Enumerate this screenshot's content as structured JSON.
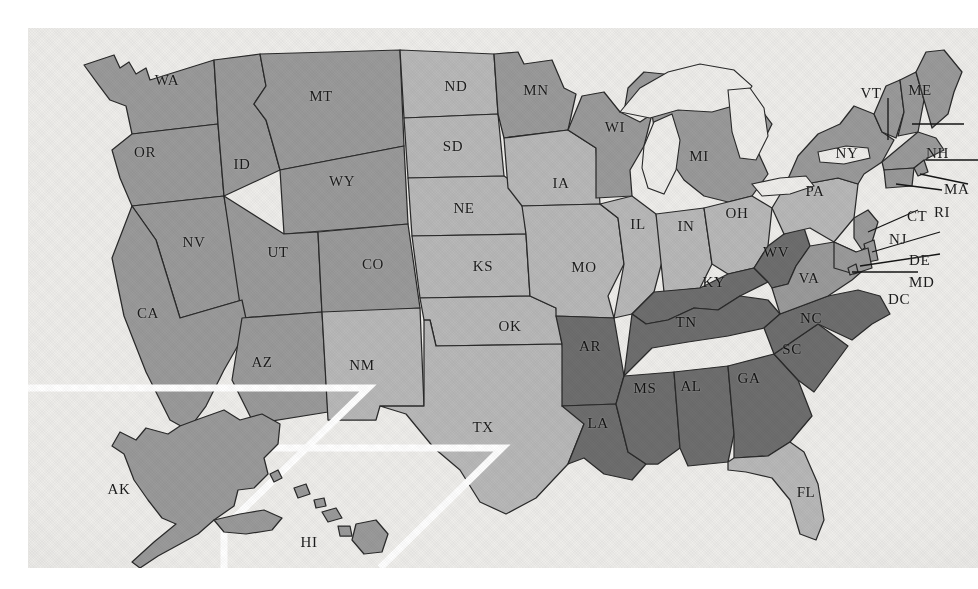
{
  "map": {
    "title": "United States state map",
    "region_highlight": "Southeastern United States",
    "legend_tiers": [
      {
        "key": "dark",
        "color": "#6e6e6e",
        "label": "Highlighted region"
      },
      {
        "key": "medium",
        "color": "#9a9a9a",
        "label": "Mid shade"
      },
      {
        "key": "light",
        "color": "#b8b8b8",
        "label": "Light shade"
      }
    ],
    "background_color": "#eeedea",
    "border_color": "#2a2a2a",
    "inset_border_color": "#ffffff"
  },
  "chart_data": {
    "type": "map",
    "projection": "albers-usa",
    "value_scale": [
      "light",
      "medium",
      "dark"
    ],
    "states": [
      {
        "code": "WA",
        "name": "Washington",
        "tier": "medium",
        "x": 139,
        "y": 52,
        "callout": false
      },
      {
        "code": "OR",
        "name": "Oregon",
        "tier": "medium",
        "x": 117,
        "y": 124,
        "callout": false
      },
      {
        "code": "ID",
        "name": "Idaho",
        "tier": "medium",
        "x": 214,
        "y": 136,
        "callout": false
      },
      {
        "code": "MT",
        "name": "Montana",
        "tier": "medium",
        "x": 293,
        "y": 68,
        "callout": false
      },
      {
        "code": "WY",
        "name": "Wyoming",
        "tier": "medium",
        "x": 314,
        "y": 153,
        "callout": false
      },
      {
        "code": "NV",
        "name": "Nevada",
        "tier": "medium",
        "x": 166,
        "y": 214,
        "callout": false
      },
      {
        "code": "UT",
        "name": "Utah",
        "tier": "medium",
        "x": 250,
        "y": 224,
        "callout": false
      },
      {
        "code": "CO",
        "name": "Colorado",
        "tier": "medium",
        "x": 345,
        "y": 236,
        "callout": false
      },
      {
        "code": "CA",
        "name": "California",
        "tier": "medium",
        "x": 120,
        "y": 285,
        "callout": false
      },
      {
        "code": "AZ",
        "name": "Arizona",
        "tier": "medium",
        "x": 234,
        "y": 334,
        "callout": false
      },
      {
        "code": "NM",
        "name": "New Mexico",
        "tier": "light",
        "x": 334,
        "y": 337,
        "callout": false
      },
      {
        "code": "ND",
        "name": "North Dakota",
        "tier": "light",
        "x": 428,
        "y": 58,
        "callout": false
      },
      {
        "code": "SD",
        "name": "South Dakota",
        "tier": "light",
        "x": 425,
        "y": 118,
        "callout": false
      },
      {
        "code": "NE",
        "name": "Nebraska",
        "tier": "light",
        "x": 436,
        "y": 180,
        "callout": false
      },
      {
        "code": "KS",
        "name": "Kansas",
        "tier": "light",
        "x": 455,
        "y": 238,
        "callout": false
      },
      {
        "code": "OK",
        "name": "Oklahoma",
        "tier": "light",
        "x": 482,
        "y": 298,
        "callout": false
      },
      {
        "code": "TX",
        "name": "Texas",
        "tier": "light",
        "x": 455,
        "y": 399,
        "callout": false
      },
      {
        "code": "MN",
        "name": "Minnesota",
        "tier": "medium",
        "x": 508,
        "y": 62,
        "callout": false
      },
      {
        "code": "IA",
        "name": "Iowa",
        "tier": "light",
        "x": 533,
        "y": 155,
        "callout": false
      },
      {
        "code": "MO",
        "name": "Missouri",
        "tier": "light",
        "x": 556,
        "y": 239,
        "callout": false
      },
      {
        "code": "AR",
        "name": "Arkansas",
        "tier": "dark",
        "x": 562,
        "y": 318,
        "callout": false
      },
      {
        "code": "LA",
        "name": "Louisiana",
        "tier": "dark",
        "x": 570,
        "y": 395,
        "callout": false
      },
      {
        "code": "WI",
        "name": "Wisconsin",
        "tier": "medium",
        "x": 587,
        "y": 99,
        "callout": false
      },
      {
        "code": "IL",
        "name": "Illinois",
        "tier": "light",
        "x": 610,
        "y": 196,
        "callout": false
      },
      {
        "code": "MS",
        "name": "Mississippi",
        "tier": "dark",
        "x": 617,
        "y": 360,
        "callout": false
      },
      {
        "code": "MI",
        "name": "Michigan",
        "tier": "medium",
        "x": 671,
        "y": 128,
        "callout": false
      },
      {
        "code": "IN",
        "name": "Indiana",
        "tier": "light",
        "x": 658,
        "y": 198,
        "callout": false
      },
      {
        "code": "TN",
        "name": "Tennessee",
        "tier": "dark",
        "x": 658,
        "y": 294,
        "callout": false
      },
      {
        "code": "AL",
        "name": "Alabama",
        "tier": "dark",
        "x": 663,
        "y": 358,
        "callout": false
      },
      {
        "code": "KY",
        "name": "Kentucky",
        "tier": "dark",
        "x": 686,
        "y": 254,
        "callout": false
      },
      {
        "code": "OH",
        "name": "Ohio",
        "tier": "light",
        "x": 709,
        "y": 185,
        "callout": false
      },
      {
        "code": "GA",
        "name": "Georgia",
        "tier": "dark",
        "x": 721,
        "y": 350,
        "callout": false
      },
      {
        "code": "WV",
        "name": "West Virginia",
        "tier": "dark",
        "x": 748,
        "y": 224,
        "callout": false
      },
      {
        "code": "SC",
        "name": "South Carolina",
        "tier": "dark",
        "x": 764,
        "y": 321,
        "callout": false
      },
      {
        "code": "FL",
        "name": "Florida",
        "tier": "light",
        "x": 778,
        "y": 464,
        "callout": false
      },
      {
        "code": "VA",
        "name": "Virginia",
        "tier": "medium",
        "x": 781,
        "y": 250,
        "callout": false
      },
      {
        "code": "PA",
        "name": "Pennsylvania",
        "tier": "light",
        "x": 787,
        "y": 163,
        "callout": false
      },
      {
        "code": "NC",
        "name": "North Carolina",
        "tier": "dark",
        "x": 783,
        "y": 290,
        "callout": false
      },
      {
        "code": "NY",
        "name": "New York",
        "tier": "medium",
        "x": 819,
        "y": 125,
        "callout": false
      },
      {
        "code": "VT",
        "name": "Vermont",
        "tier": "medium",
        "x": 843,
        "y": 65,
        "callout": false
      },
      {
        "code": "ME",
        "name": "Maine",
        "tier": "medium",
        "x": 892,
        "y": 62,
        "callout": false
      },
      {
        "code": "AK",
        "name": "Alaska",
        "tier": "medium",
        "x": 91,
        "y": 461,
        "callout": false
      },
      {
        "code": "HI",
        "name": "Hawaii",
        "tier": "light",
        "x": 281,
        "y": 514,
        "callout": false
      },
      {
        "code": "NH",
        "name": "New Hampshire",
        "tier": "medium",
        "x": 898,
        "y": 125,
        "callout": true
      },
      {
        "code": "MA",
        "name": "Massachusetts",
        "tier": "medium",
        "x": 916,
        "y": 161,
        "callout": true
      },
      {
        "code": "RI",
        "name": "Rhode Island",
        "tier": "medium",
        "x": 906,
        "y": 184,
        "callout": true
      },
      {
        "code": "CT",
        "name": "Connecticut",
        "tier": "medium",
        "x": 879,
        "y": 188,
        "callout": true
      },
      {
        "code": "NJ",
        "name": "New Jersey",
        "tier": "medium",
        "x": 861,
        "y": 211,
        "callout": true
      },
      {
        "code": "DE",
        "name": "Delaware",
        "tier": "medium",
        "x": 881,
        "y": 232,
        "callout": true
      },
      {
        "code": "MD",
        "name": "Maryland",
        "tier": "medium",
        "x": 881,
        "y": 254,
        "callout": true
      },
      {
        "code": "DC",
        "name": "District of Columbia",
        "tier": "medium",
        "x": 860,
        "y": 271,
        "callout": true
      }
    ],
    "highlighted_states": [
      "AR",
      "LA",
      "MS",
      "AL",
      "GA",
      "SC",
      "NC",
      "TN",
      "KY",
      "WV"
    ],
    "insets": [
      {
        "name": "Alaska inset",
        "code": "AK"
      },
      {
        "name": "Hawaii inset",
        "code": "HI"
      }
    ]
  }
}
